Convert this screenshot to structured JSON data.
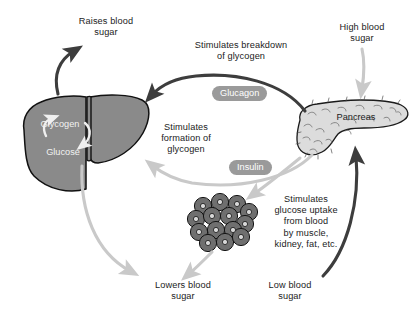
{
  "diagram": {
    "colors": {
      "background": "#ffffff",
      "text": "#1b1b1b",
      "liver_fill": "#8a8a8a",
      "liver_stroke": "#111111",
      "pancreas_fill": "#dcdcdc",
      "pancreas_stroke": "#1a1a1a",
      "cell_fill": "#6f6f6f",
      "cell_stroke": "#111111",
      "dark_arrow": "#3d3d3d",
      "light_arrow": "#c9c9c9",
      "pill_background": "#9a9a9a",
      "pill_text": "#ffffff"
    },
    "organs": [
      {
        "id": "liver",
        "label": "",
        "note": "liver silhouette, left side"
      },
      {
        "id": "pancreas",
        "label": "Pancreas",
        "note": "stippled pancreas, right side"
      },
      {
        "id": "cells",
        "label": "",
        "note": "cluster of body cells, center bottom"
      }
    ],
    "organ_labels": {
      "pancreas": "Pancreas",
      "liver_glycogen": "Glycogen",
      "liver_glucose": "Glucose"
    },
    "hormones": [
      {
        "id": "glucagon",
        "label": "Glucagon"
      },
      {
        "id": "insulin",
        "label": "Insulin"
      }
    ],
    "labels": {
      "raises_blood_sugar": "Raises blood\nsugar",
      "high_blood_sugar": "High blood\nsugar",
      "low_blood_sugar": "Low blood\nsugar",
      "lowers_blood_sugar": "Lowers blood\nsugar",
      "stimulates_breakdown": "Stimulates breakdown\nof glycogen",
      "stimulates_formation": "Stimulates\nformation of\nglycogen",
      "stimulates_uptake": "Stimulates\nglucose uptake\nfrom blood\nby muscle,\nkidney, fat, etc."
    },
    "arrows": [
      {
        "id": "liver-to-raises",
        "from": "liver",
        "to": "raises-blood-sugar",
        "tone": "dark"
      },
      {
        "id": "pancreas-to-liver-glucagon",
        "from": "pancreas",
        "to": "liver",
        "tone": "dark",
        "hormone": "glucagon"
      },
      {
        "id": "high-sugar-to-pancreas",
        "from": "high-blood-sugar",
        "to": "pancreas",
        "tone": "light"
      },
      {
        "id": "low-sugar-to-pancreas",
        "from": "low-blood-sugar",
        "to": "pancreas",
        "tone": "dark"
      },
      {
        "id": "pancreas-to-liver-insulin",
        "from": "pancreas",
        "to": "liver",
        "tone": "light",
        "hormone": "insulin"
      },
      {
        "id": "pancreas-to-cells-insulin",
        "from": "pancreas",
        "to": "cells",
        "tone": "light",
        "hormone": "insulin"
      },
      {
        "id": "liver-to-lowers",
        "from": "liver",
        "to": "lowers-blood-sugar",
        "tone": "light"
      },
      {
        "id": "cells-to-lowers",
        "from": "cells",
        "to": "lowers-blood-sugar",
        "tone": "light"
      }
    ]
  }
}
